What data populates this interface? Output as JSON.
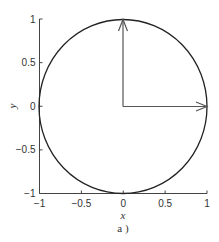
{
  "chart_data": {
    "type": "line",
    "title": "",
    "caption": "a )",
    "xlabel": "x",
    "ylabel": "y",
    "xlim": [
      -1,
      1
    ],
    "ylim": [
      -1,
      1
    ],
    "grid": false,
    "x_ticks": [
      -1,
      -0.5,
      0,
      0.5,
      1
    ],
    "x_tick_labels": [
      "−1",
      "−0.5",
      "0",
      "0.5",
      "1"
    ],
    "y_ticks": [
      -1,
      -0.5,
      0,
      0.5,
      1
    ],
    "y_tick_labels": [
      "−1",
      "−0.5",
      "0",
      "0.5",
      "1"
    ],
    "series": [
      {
        "name": "unit circle",
        "shape": "circle",
        "center": [
          0,
          0
        ],
        "radius": 1,
        "color": "#222222"
      }
    ],
    "arrows": [
      {
        "name": "vector-x",
        "from": [
          0,
          0
        ],
        "to": [
          1,
          0
        ],
        "color": "#555555"
      },
      {
        "name": "vector-y",
        "from": [
          0,
          0
        ],
        "to": [
          0,
          1
        ],
        "color": "#555555"
      }
    ]
  }
}
